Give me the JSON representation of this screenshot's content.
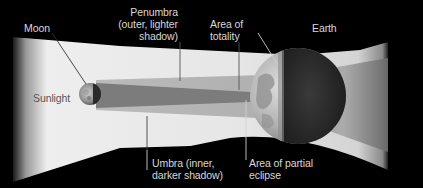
{
  "diagram": {
    "bodies": {
      "moon": "Moon",
      "earth": "Earth"
    },
    "labels": {
      "moon": "Moon",
      "sunlight": "Sunlight",
      "penumbra": "Penumbra\n(outer, lighter\nshadow)",
      "totality": "Area of\ntotality",
      "earth": "Earth",
      "umbra": "Umbra (inner,\ndarker shadow)",
      "partial": "Area of partial\neclipse"
    },
    "colors": {
      "background": "#000000",
      "sunlight": "#e8e8e8",
      "penumbra": "#b4b4b4",
      "umbra": "#7a7a7a",
      "text": "#d8d8d8",
      "earth_lit": "#bdbdbd",
      "earth_dark": "#2a2a2a"
    }
  }
}
